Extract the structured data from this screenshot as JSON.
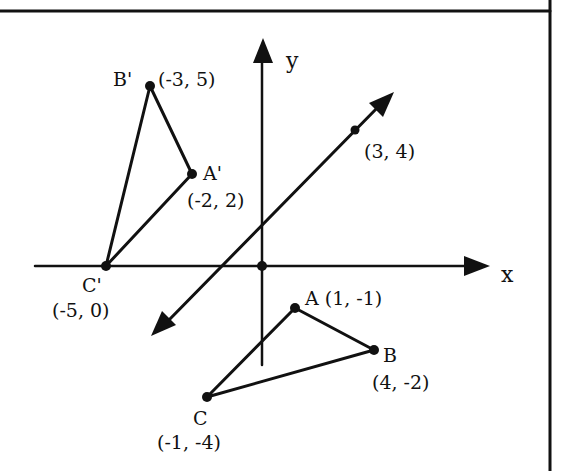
{
  "figure": {
    "axes": {
      "x_label": "x",
      "y_label": "y"
    },
    "line": {
      "point_label": "(3, 4)"
    },
    "triangle_original": {
      "A": {
        "name": "A",
        "coords": "(1, -1)",
        "label": "A (1, -1)"
      },
      "B": {
        "name": "B",
        "coords": "(4, -2)"
      },
      "C": {
        "name": "C",
        "coords": "(-1, -4)"
      }
    },
    "triangle_image": {
      "A_prime": {
        "name": "A'",
        "coords": "(-2, 2)"
      },
      "B_prime": {
        "name": "B'",
        "coords": "(-3, 5)"
      },
      "C_prime": {
        "name": "C'",
        "coords": "(-5, 0)"
      }
    }
  }
}
